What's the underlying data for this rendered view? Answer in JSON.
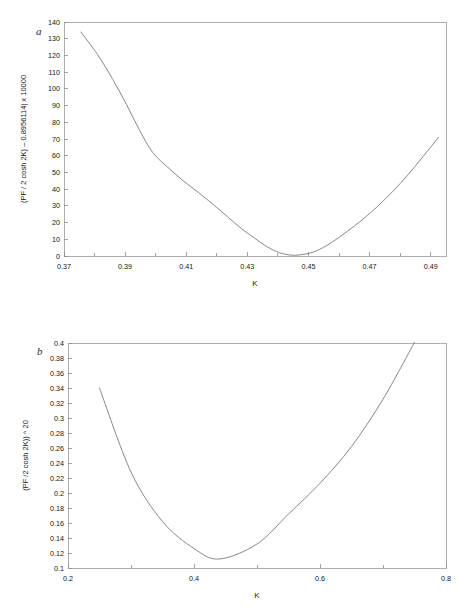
{
  "figure": {
    "background_color": "#ffffff",
    "line_color": "#7a7a7a",
    "axis_color": "#8d8d8d",
    "text_color": "#161616"
  },
  "panels": [
    {
      "letter": "a",
      "letter_name": "panel-label-a"
    },
    {
      "letter": "b",
      "letter_name": "panel-label-b"
    }
  ],
  "chart_data": [
    {
      "type": "line",
      "panel": "a",
      "title": "",
      "xlabel": "K",
      "ylabel": "(PF / 2 cosh 2K) – 0.8956114| x 10000",
      "xlim": [
        0.37,
        0.495
      ],
      "ylim": [
        0,
        140
      ],
      "xticks": [
        0.37,
        0.39,
        0.41,
        0.43,
        0.45,
        0.47,
        0.49
      ],
      "xticklabels": [
        "0.37",
        "0.39",
        "0.41",
        "0.43",
        "0.45",
        "0.47",
        "0.49"
      ],
      "xminorticks": [
        0.38,
        0.4,
        0.42,
        0.44,
        0.46,
        0.48
      ],
      "yticks": [
        0,
        10,
        20,
        30,
        40,
        50,
        60,
        70,
        80,
        90,
        100,
        110,
        120,
        130,
        140
      ],
      "yticklabels": [
        "0",
        "10",
        "20",
        "30",
        "40",
        "50",
        "60",
        "70",
        "80",
        "90",
        "100",
        "110",
        "120",
        "130",
        "140"
      ],
      "grid": false,
      "legend": "none",
      "x": [
        0.3755,
        0.381,
        0.386,
        0.3905,
        0.3945,
        0.399,
        0.404,
        0.409,
        0.414,
        0.419,
        0.4235,
        0.428,
        0.4325,
        0.4365,
        0.4405,
        0.4445,
        0.4485,
        0.4525,
        0.4575,
        0.4625,
        0.4675,
        0.4725,
        0.4775,
        0.4825,
        0.4875,
        0.4925
      ],
      "y": [
        134.0,
        120.5,
        105.5,
        90.5,
        76.0,
        62.0,
        53.0,
        45.0,
        38.0,
        30.5,
        23.5,
        16.5,
        10.5,
        5.5,
        2.0,
        0.5,
        1.0,
        3.0,
        8.0,
        14.5,
        21.5,
        29.5,
        38.5,
        48.5,
        59.5,
        71.0
      ]
    },
    {
      "type": "line",
      "panel": "b",
      "title": "",
      "xlabel": "K",
      "ylabel": "(PF /2 cosh 2K)) ^ 20",
      "xlim": [
        0.2,
        0.8
      ],
      "ylim": [
        0.1,
        0.4
      ],
      "xticks": [
        0.2,
        0.4,
        0.6,
        0.8
      ],
      "xticklabels": [
        "0.2",
        "0.4",
        "0.6",
        "0.8"
      ],
      "xminorticks": [
        0.3,
        0.5,
        0.7
      ],
      "yticks": [
        0.1,
        0.12,
        0.14,
        0.16,
        0.18,
        0.2,
        0.22,
        0.24,
        0.26,
        0.28,
        0.3,
        0.32,
        0.34,
        0.36,
        0.38,
        0.4
      ],
      "yticklabels": [
        "0.1",
        "0.12",
        "0.14",
        "0.16",
        "0.18",
        "0.2",
        "0.22",
        "0.24",
        "0.26",
        "0.28",
        "0.3",
        "0.32",
        "0.34",
        "0.36",
        "0.38",
        "0.4"
      ],
      "grid": false,
      "legend": "none",
      "x": [
        0.25,
        0.3,
        0.35,
        0.4,
        0.44,
        0.5,
        0.55,
        0.6,
        0.65,
        0.7,
        0.75
      ],
      "y": [
        0.34,
        0.228,
        0.162,
        0.126,
        0.112,
        0.132,
        0.172,
        0.213,
        0.262,
        0.325,
        0.401
      ]
    }
  ]
}
